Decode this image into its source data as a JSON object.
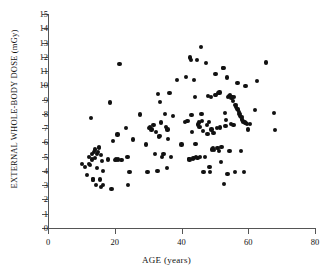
{
  "chart_data": {
    "type": "scatter",
    "title": "",
    "xlabel": "AGE (years)",
    "ylabel": "EXTERNAL  WHOLE-BODY  DOSE  (mGy)",
    "xlim": [
      0,
      80
    ],
    "ylim": [
      0,
      15
    ],
    "xticks": [
      0,
      20,
      40,
      60,
      80
    ],
    "yticks": [
      0,
      1,
      2,
      3,
      4,
      5,
      6,
      7,
      8,
      9,
      10,
      11,
      12,
      13,
      14,
      15
    ],
    "grid": false,
    "legend": null,
    "marker": "filled-circle",
    "marker_color": "#111111",
    "point_count": 162,
    "points": [
      [
        10.3,
        4.5
      ],
      [
        11.0,
        4.3
      ],
      [
        11.6,
        3.7
      ],
      [
        12.2,
        4.5
      ],
      [
        12.4,
        5.0
      ],
      [
        12.6,
        4.4
      ],
      [
        13.0,
        7.7
      ],
      [
        13.1,
        5.2
      ],
      [
        13.3,
        4.8
      ],
      [
        13.5,
        3.4
      ],
      [
        13.6,
        3.4
      ],
      [
        13.8,
        5.3
      ],
      [
        14.0,
        4.9
      ],
      [
        14.2,
        5.5
      ],
      [
        14.4,
        3.0
      ],
      [
        14.6,
        5.2
      ],
      [
        14.8,
        4.2
      ],
      [
        15.0,
        5.3
      ],
      [
        15.2,
        5.6
      ],
      [
        15.4,
        5.7
      ],
      [
        15.6,
        3.4
      ],
      [
        15.8,
        2.9
      ],
      [
        16.0,
        5.1
      ],
      [
        16.2,
        4.7
      ],
      [
        16.4,
        4.0
      ],
      [
        16.6,
        3.0
      ],
      [
        18.0,
        4.8
      ],
      [
        18.6,
        8.8
      ],
      [
        19.0,
        2.75
      ],
      [
        19.4,
        6.1
      ],
      [
        20.0,
        4.75
      ],
      [
        20.4,
        4.8
      ],
      [
        20.8,
        6.55
      ],
      [
        21.4,
        11.5
      ],
      [
        22.0,
        4.75
      ],
      [
        23.4,
        7.0
      ],
      [
        23.8,
        5.0
      ],
      [
        24.0,
        3.0
      ],
      [
        24.4,
        3.9
      ],
      [
        25.4,
        6.2
      ],
      [
        27.6,
        7.95
      ],
      [
        29.4,
        5.85
      ],
      [
        29.8,
        3.9
      ],
      [
        30.6,
        7.05
      ],
      [
        31.0,
        6.9
      ],
      [
        31.6,
        7.2
      ],
      [
        32.0,
        5.2
      ],
      [
        32.4,
        6.75
      ],
      [
        32.8,
        4.0
      ],
      [
        33.0,
        9.4
      ],
      [
        33.2,
        6.4
      ],
      [
        33.4,
        6.45
      ],
      [
        33.6,
        8.85
      ],
      [
        33.8,
        7.4
      ],
      [
        34.2,
        4.95
      ],
      [
        34.6,
        5.2
      ],
      [
        35.0,
        8.0
      ],
      [
        35.4,
        7.1
      ],
      [
        35.6,
        4.2
      ],
      [
        35.8,
        6.9
      ],
      [
        36.0,
        6.25
      ],
      [
        36.4,
        9.45
      ],
      [
        36.8,
        4.95
      ],
      [
        37.4,
        7.85
      ],
      [
        38.6,
        10.35
      ],
      [
        40.0,
        5.85
      ],
      [
        41.0,
        7.45
      ],
      [
        41.4,
        10.6
      ],
      [
        41.8,
        7.5
      ],
      [
        42.2,
        4.85
      ],
      [
        42.4,
        4.8
      ],
      [
        42.6,
        11.95
      ],
      [
        42.8,
        11.75
      ],
      [
        43.0,
        7.9
      ],
      [
        43.2,
        6.75
      ],
      [
        43.4,
        4.85
      ],
      [
        43.6,
        4.9
      ],
      [
        43.8,
        10.35
      ],
      [
        44.0,
        9.2
      ],
      [
        44.2,
        5.9
      ],
      [
        44.4,
        5.0
      ],
      [
        44.6,
        11.75
      ],
      [
        44.8,
        4.9
      ],
      [
        45.0,
        7.25
      ],
      [
        45.2,
        7.4
      ],
      [
        45.4,
        7.1
      ],
      [
        45.6,
        5.0
      ],
      [
        45.8,
        12.7
      ],
      [
        46.0,
        8.0
      ],
      [
        46.2,
        7.5
      ],
      [
        46.4,
        6.8
      ],
      [
        46.6,
        3.95
      ],
      [
        47.0,
        5.0
      ],
      [
        47.4,
        11.55
      ],
      [
        47.6,
        7.2
      ],
      [
        47.8,
        6.6
      ],
      [
        48.0,
        9.25
      ],
      [
        48.2,
        7.45
      ],
      [
        48.4,
        4.25
      ],
      [
        48.6,
        3.9
      ],
      [
        48.8,
        9.2
      ],
      [
        49.0,
        6.9
      ],
      [
        49.2,
        5.5
      ],
      [
        49.4,
        5.6
      ],
      [
        49.6,
        6.65
      ],
      [
        49.8,
        5.45
      ],
      [
        50.0,
        9.3
      ],
      [
        50.2,
        10.8
      ],
      [
        50.4,
        9.35
      ],
      [
        50.6,
        7.0
      ],
      [
        50.8,
        5.6
      ],
      [
        51.0,
        9.45
      ],
      [
        51.2,
        5.4
      ],
      [
        51.4,
        9.5
      ],
      [
        51.6,
        7.05
      ],
      [
        51.8,
        4.6
      ],
      [
        52.0,
        5.65
      ],
      [
        52.4,
        11.2
      ],
      [
        52.6,
        11.2
      ],
      [
        52.8,
        3.1
      ],
      [
        53.0,
        8.05
      ],
      [
        53.2,
        7.15
      ],
      [
        53.4,
        7.55
      ],
      [
        53.6,
        10.55
      ],
      [
        53.8,
        3.8
      ],
      [
        54.0,
        9.2
      ],
      [
        54.2,
        9.25
      ],
      [
        54.4,
        5.4
      ],
      [
        54.6,
        9.3
      ],
      [
        54.8,
        7.3
      ],
      [
        55.0,
        9.15
      ],
      [
        55.2,
        9.2
      ],
      [
        55.4,
        8.9
      ],
      [
        55.6,
        7.2
      ],
      [
        55.8,
        9.2
      ],
      [
        56.0,
        3.95
      ],
      [
        56.2,
        8.6
      ],
      [
        56.4,
        8.5
      ],
      [
        56.6,
        8.35
      ],
      [
        56.8,
        10.15
      ],
      [
        57.0,
        8.3
      ],
      [
        57.2,
        8.15
      ],
      [
        57.4,
        8.0
      ],
      [
        57.6,
        7.85
      ],
      [
        57.8,
        5.4
      ],
      [
        58.0,
        7.8
      ],
      [
        58.2,
        7.6
      ],
      [
        58.4,
        7.5
      ],
      [
        58.6,
        7.45
      ],
      [
        58.8,
        3.95
      ],
      [
        59.0,
        7.4
      ],
      [
        59.2,
        9.95
      ],
      [
        59.4,
        7.35
      ],
      [
        59.6,
        7.3
      ],
      [
        60.0,
        6.9
      ],
      [
        60.6,
        7.3
      ],
      [
        62.0,
        8.25
      ],
      [
        62.6,
        10.3
      ],
      [
        65.4,
        11.6
      ],
      [
        67.8,
        8.05
      ],
      [
        68.0,
        6.85
      ],
      [
        30.2,
        7.0
      ],
      [
        21.0,
        4.8
      ]
    ]
  }
}
